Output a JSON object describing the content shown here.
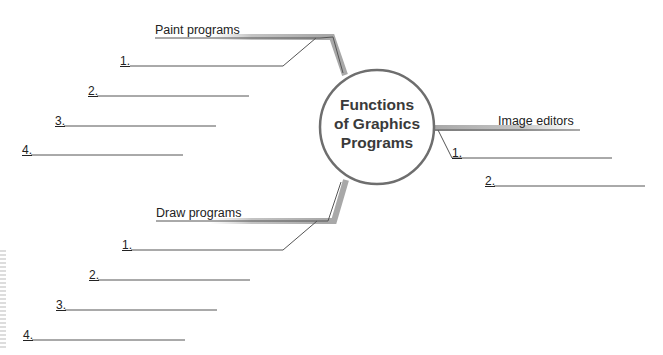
{
  "diagram": {
    "type": "mind-map",
    "center": {
      "title_lines": [
        "Functions",
        "of Graphics",
        "Programs"
      ]
    },
    "branches": [
      {
        "label": "Paint programs",
        "items": [
          "1.",
          "2.",
          "3.",
          "4."
        ]
      },
      {
        "label": "Image editors",
        "items": [
          "1.",
          "2."
        ]
      },
      {
        "label": "Draw programs",
        "items": [
          "1.",
          "2.",
          "3.",
          "4."
        ]
      }
    ],
    "colors": {
      "line": "#555555",
      "bar": "#a8a8a8",
      "circle_stroke": "#6e6e6e",
      "text": "#222222"
    }
  }
}
